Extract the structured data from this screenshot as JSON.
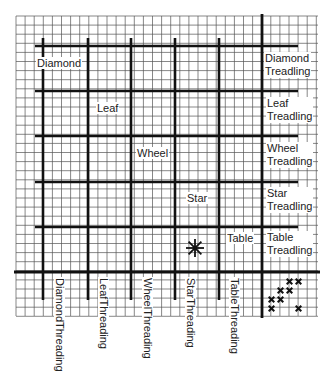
{
  "diagram": {
    "title": "",
    "grid": {
      "left": 16,
      "top": 16,
      "right": 318,
      "bottom": 316,
      "cell": 9.1,
      "thin_color": "#555555",
      "thick_color": "#111111"
    },
    "thick_verticals": [
      43,
      88,
      131,
      175,
      219
    ],
    "thick_vertical_range": [
      38,
      300
    ],
    "full_vertical": 262,
    "thick_horizontals": [
      46,
      91,
      136,
      182,
      227
    ],
    "thick_horizontal_range": [
      35,
      298
    ],
    "full_horizontal": 272,
    "block_labels": [
      {
        "text": "Diamond",
        "x": 36,
        "y": 63
      },
      {
        "text": "Leaf",
        "x": 96,
        "y": 108
      },
      {
        "text": "Wheel",
        "x": 136,
        "y": 153
      },
      {
        "text": "Star",
        "x": 186,
        "y": 198
      },
      {
        "text": "Table",
        "x": 226,
        "y": 238
      }
    ],
    "treadling_labels": [
      {
        "line1": "Diamond",
        "line2": "Treadling",
        "x": 264,
        "y": 52
      },
      {
        "line1": "Leaf",
        "line2": "Treadling",
        "x": 266,
        "y": 97
      },
      {
        "line1": "Wheel",
        "line2": "Treadling",
        "x": 266,
        "y": 142
      },
      {
        "line1": "Star",
        "line2": "Treadling",
        "x": 266,
        "y": 187
      },
      {
        "line1": "Table",
        "line2": "Treadling",
        "x": 266,
        "y": 231
      }
    ],
    "threading_labels": [
      {
        "line1": "Diamond",
        "line2": "Threading",
        "x": 54,
        "y": 277
      },
      {
        "line1": "Leaf",
        "line2": "Threading",
        "x": 98,
        "y": 277
      },
      {
        "line1": "Wheel",
        "line2": "Threading",
        "x": 142,
        "y": 277
      },
      {
        "line1": "Star",
        "line2": "Threading",
        "x": 185,
        "y": 277
      },
      {
        "line1": "Table",
        "line2": "Threading",
        "x": 229,
        "y": 277
      }
    ],
    "star_marker": {
      "x": 195,
      "y": 248,
      "symbol": "asterisk"
    },
    "tieup_marks": [
      {
        "x": 285,
        "y": 277
      },
      {
        "x": 294,
        "y": 277
      },
      {
        "x": 276,
        "y": 286
      },
      {
        "x": 285,
        "y": 286
      },
      {
        "x": 267,
        "y": 295
      },
      {
        "x": 276,
        "y": 295
      },
      {
        "x": 267,
        "y": 304
      },
      {
        "x": 294,
        "y": 304
      }
    ]
  }
}
